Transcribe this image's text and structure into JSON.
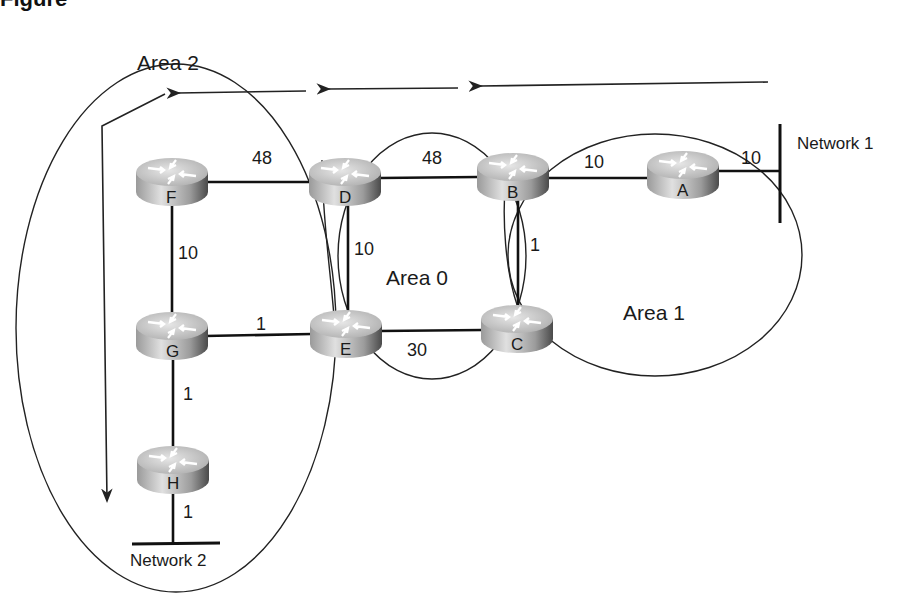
{
  "figure": {
    "heading": "Figure"
  },
  "areas": [
    {
      "id": "area2",
      "label": "Area 2"
    },
    {
      "id": "area0",
      "label": "Area 0"
    },
    {
      "id": "area1",
      "label": "Area 1"
    }
  ],
  "routers": [
    {
      "id": "A",
      "label": "A",
      "x": 683,
      "y": 172
    },
    {
      "id": "B",
      "label": "B",
      "x": 512,
      "y": 172
    },
    {
      "id": "C",
      "label": "C",
      "x": 517,
      "y": 328
    },
    {
      "id": "D",
      "label": "D",
      "x": 345,
      "y": 172
    },
    {
      "id": "E",
      "label": "E",
      "x": 345,
      "y": 328
    },
    {
      "id": "F",
      "label": "F",
      "x": 172,
      "y": 172
    },
    {
      "id": "G",
      "label": "G",
      "x": 172,
      "y": 328
    },
    {
      "id": "H",
      "label": "H",
      "x": 172,
      "y": 461
    }
  ],
  "links": [
    {
      "from": "F",
      "to": "D",
      "cost": "48"
    },
    {
      "from": "D",
      "to": "B",
      "cost": "48"
    },
    {
      "from": "B",
      "to": "A",
      "cost": "10"
    },
    {
      "from": "A",
      "to": "Network 1",
      "cost": "10"
    },
    {
      "from": "F",
      "to": "G",
      "cost": "10"
    },
    {
      "from": "D",
      "to": "E",
      "cost": "10"
    },
    {
      "from": "B",
      "to": "C",
      "cost": "1"
    },
    {
      "from": "G",
      "to": "E",
      "cost": "1"
    },
    {
      "from": "E",
      "to": "C",
      "cost": "30"
    },
    {
      "from": "G",
      "to": "H",
      "cost": "1"
    },
    {
      "from": "H",
      "to": "Network 2",
      "cost": "1"
    }
  ],
  "networks": [
    {
      "id": "net1",
      "label": "Network 1"
    },
    {
      "id": "net2",
      "label": "Network 2"
    }
  ],
  "colors": {
    "router_top": "#d9d9d9",
    "router_side_light": "#c8c8c8",
    "router_side_dark": "#5a5a5a",
    "line": "#111111"
  }
}
